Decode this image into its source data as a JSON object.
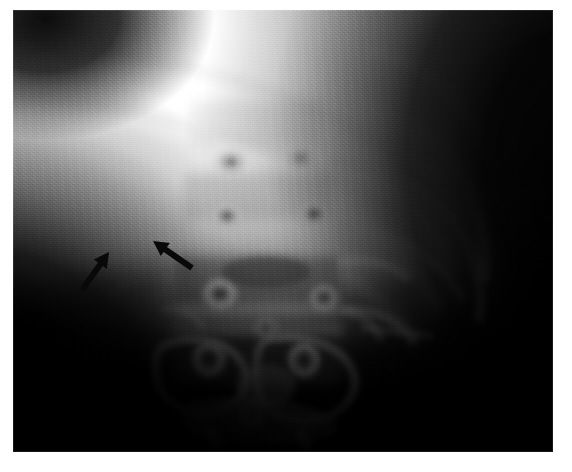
{
  "figure": {
    "kind": "radiograph",
    "modality_label": "x-ray",
    "caption": "",
    "background_color": "#ffffff",
    "plate": {
      "x": 13,
      "y": 10,
      "width": 540,
      "height": 442,
      "film_black": "#050505",
      "film_white": "#ffffff"
    },
    "annotations": [
      {
        "id": "arrow-left",
        "name": "annotation-arrow-1",
        "type": "arrow",
        "color": "#0a0a0a",
        "tail_x": 82,
        "tail_y": 290,
        "tip_x": 109,
        "tip_y": 252,
        "direction": "up-right",
        "length_px": 47
      },
      {
        "id": "arrow-right",
        "name": "annotation-arrow-2",
        "type": "arrow",
        "color": "#0a0a0a",
        "tail_x": 192,
        "tail_y": 268,
        "tip_x": 153,
        "tip_y": 241,
        "direction": "up-left",
        "length_px": 47
      }
    ],
    "regions": [
      {
        "name": "upper-bright-field",
        "description": "near-white soft tissue / diaphragm region occupying the upper half",
        "tone": "#fbfbfb"
      },
      {
        "name": "lower-left-dark-field",
        "description": "black flank shadow in the lower-left corner",
        "tone": "#050505"
      },
      {
        "name": "right-dark-field",
        "description": "black background column along the right edge",
        "tone": "#030303"
      },
      {
        "name": "vertebral-column",
        "description": "central stack of vertebral bodies with bright ring-shaped pedicles",
        "tone": "#d8d8d8"
      },
      {
        "name": "rib-arcs",
        "description": "curved rib shadows crossing the upper and right fields",
        "tone": "#e9e9e9"
      },
      {
        "name": "crossing-rib-artifact",
        "description": "bright X-shaped crossing at the top-left corner",
        "tone": "#ffffff"
      }
    ]
  }
}
